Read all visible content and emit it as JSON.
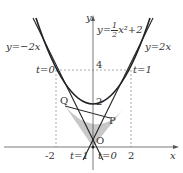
{
  "figure": {
    "axes": {
      "x_label": "x",
      "y_label": "y",
      "origin_label": "O",
      "x_ticks": [
        "-2",
        "2"
      ],
      "y_ticks": [
        "2",
        "4"
      ]
    },
    "curves": {
      "parabola_label": "y=",
      "parabola_num": "1",
      "parabola_den": "2",
      "parabola_rest": "x²+2",
      "left_line_label": "y=−2x",
      "right_line_label": "y=2x"
    },
    "points": {
      "P": "P",
      "Q": "Q"
    },
    "parameter_labels": {
      "top_left": "t=0",
      "top_right": "t=1",
      "bottom_left": "t=1",
      "bottom_right": "t=0"
    },
    "colors": {
      "curve": "#222222",
      "axis": "#555555",
      "shade": "#c8c8c8",
      "dotted": "#888888"
    }
  }
}
